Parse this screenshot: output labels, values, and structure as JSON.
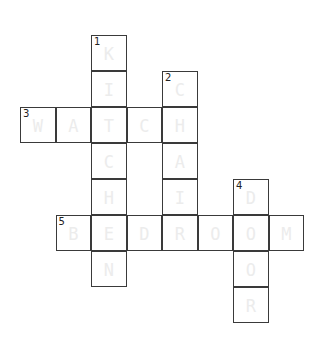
{
  "puzzle": {
    "grid_origin": {
      "x": 20,
      "y": 35
    },
    "cell_size": {
      "w": 35.5,
      "h": 36
    },
    "colors": {
      "border": "#3a3a3a",
      "letter": "#ececec",
      "number": "#222222"
    },
    "words": [
      {
        "number": "1",
        "direction": "down",
        "row": 0,
        "col": 2,
        "answer": "KITCHEN"
      },
      {
        "number": "2",
        "direction": "down",
        "row": 1,
        "col": 4,
        "answer": "CHAIR"
      },
      {
        "number": "3",
        "direction": "across",
        "row": 2,
        "col": 0,
        "answer": "WATCH"
      },
      {
        "number": "4",
        "direction": "down",
        "row": 4,
        "col": 6,
        "answer": "DOOR"
      },
      {
        "number": "5",
        "direction": "across",
        "row": 5,
        "col": 1,
        "answer": "BEDROOM"
      }
    ]
  }
}
